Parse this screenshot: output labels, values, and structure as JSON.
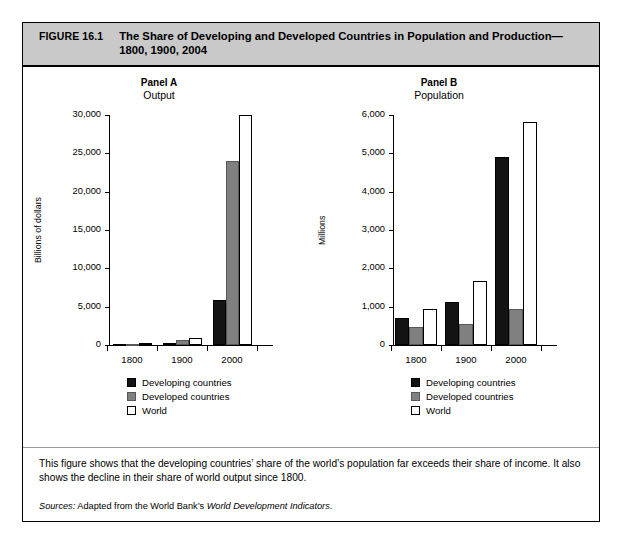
{
  "figure": {
    "number": "FIGURE 16.1",
    "title": "The Share of Developing and Developed Countries in Population and Production— 1800, 1900, 2004"
  },
  "caption": "This figure shows that the developing countries’ share of the world’s population far exceeds their share of income. It also shows the decline in their share of world output since 1800.",
  "sources": {
    "label": "Sources:",
    "text_before": " Adapted from the World Bank’s ",
    "italic": "World Development Indicators",
    "text_after": "."
  },
  "legend": {
    "items": [
      {
        "key": "developing",
        "label": "Developing countries",
        "color": "#131313"
      },
      {
        "key": "developed",
        "label": "Developed countries",
        "color": "#808080"
      },
      {
        "key": "world",
        "label": "World",
        "color": "#ffffff"
      }
    ]
  },
  "chart_data": [
    {
      "id": "panel-a",
      "type": "bar",
      "title": "Panel A",
      "subtitle": "Output",
      "xlabel": "",
      "ylabel": "Billions of dollars",
      "categories": [
        "1800",
        "1900",
        "2000"
      ],
      "ylim": [
        0,
        30000
      ],
      "yticks": [
        0,
        5000,
        10000,
        15000,
        20000,
        25000,
        30000
      ],
      "ytick_labels": [
        "0",
        "5,000",
        "10,000",
        "15,000",
        "20,000",
        "25,000",
        "30,000"
      ],
      "grid": false,
      "legend_position": "below",
      "series": [
        {
          "name": "Developing countries",
          "key": "developing",
          "values": [
            110,
            230,
            5900
          ]
        },
        {
          "name": "Developed countries",
          "key": "developed",
          "values": [
            160,
            680,
            23950
          ]
        },
        {
          "name": "World",
          "key": "world",
          "values": [
            270,
            910,
            29950
          ]
        }
      ]
    },
    {
      "id": "panel-b",
      "type": "bar",
      "title": "Panel B",
      "subtitle": "Population",
      "xlabel": "",
      "ylabel": "Millions",
      "categories": [
        "1800",
        "1900",
        "2000"
      ],
      "ylim": [
        0,
        6000
      ],
      "yticks": [
        0,
        1000,
        2000,
        3000,
        4000,
        5000,
        6000
      ],
      "ytick_labels": [
        "0",
        "1,000",
        "2,000",
        "3,000",
        "4,000",
        "5,000",
        "6,000"
      ],
      "grid": false,
      "legend_position": "below",
      "series": [
        {
          "name": "Developing countries",
          "key": "developing",
          "values": [
            700,
            1120,
            4900
          ]
        },
        {
          "name": "Developed countries",
          "key": "developed",
          "values": [
            480,
            550,
            930
          ]
        },
        {
          "name": "World",
          "key": "world",
          "values": [
            950,
            1680,
            5820
          ]
        }
      ]
    }
  ]
}
